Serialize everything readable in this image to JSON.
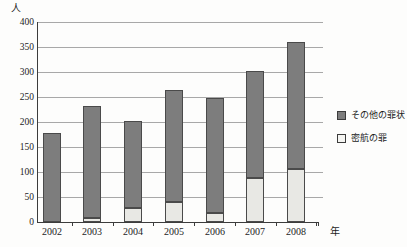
{
  "chart_data": {
    "type": "bar",
    "stacked": true,
    "title": "",
    "y_axis": {
      "unit_label": "人",
      "min": 0,
      "max": 400,
      "step": 50,
      "tick_labels": [
        "400",
        "350",
        "300",
        "250",
        "200",
        "150",
        "100",
        "50",
        "0"
      ]
    },
    "x_axis": {
      "unit_label": "年"
    },
    "categories": [
      "2002",
      "2003",
      "2004",
      "2005",
      "2006",
      "2007",
      "2008"
    ],
    "series": [
      {
        "name": "密航の罪",
        "stack_position": "bottom",
        "swatch": "light",
        "values": [
          0,
          7,
          28,
          40,
          18,
          87,
          105
        ]
      },
      {
        "name": "その他の罪状",
        "stack_position": "top",
        "swatch": "dark",
        "values": [
          178,
          223,
          174,
          223,
          230,
          214,
          253
        ]
      }
    ],
    "stack_totals": [
      178,
      230,
      202,
      263,
      248,
      301,
      358
    ],
    "grid": true,
    "legend": {
      "position": "right",
      "entries": [
        {
          "label": "その他の罪状",
          "swatch": "dark"
        },
        {
          "label": "密航の罪",
          "swatch": "light"
        }
      ]
    }
  },
  "colors": {
    "dark_series": "#7d7d7d",
    "light_series": "#e8e8e4",
    "bar_outline": "#4a4a4a",
    "gridline": "#a8a8a8",
    "axis": "#3c3c3c",
    "text": "#1c1c1c",
    "background": "#fdfdfc",
    "legend_light_swatch": "#f5f5f2"
  }
}
